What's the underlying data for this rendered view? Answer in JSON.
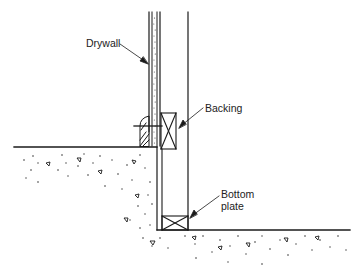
{
  "diagram": {
    "type": "construction-section-detail",
    "labels": {
      "drywall": "Drywall",
      "backing": "Backing",
      "bottom_plate_line1": "Bottom",
      "bottom_plate_line2": "plate"
    },
    "colors": {
      "line": "#1a1a1a",
      "background": "#ffffff",
      "aggregate": "#333333"
    }
  }
}
